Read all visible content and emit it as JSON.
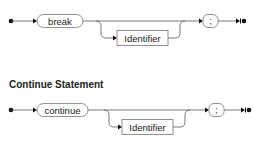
{
  "diagrams": [
    {
      "name": "break-statement",
      "heading": "",
      "terminals": {
        "keyword": "break",
        "optional": "Identifier",
        "end": ";"
      }
    },
    {
      "name": "continue-statement",
      "heading": "Continue Statement",
      "terminals": {
        "keyword": "continue",
        "optional": "Identifier",
        "end": ";"
      }
    }
  ],
  "colors": {
    "line": "#555555",
    "box_border": "#777777",
    "text": "#222222",
    "dot": "#111111"
  }
}
